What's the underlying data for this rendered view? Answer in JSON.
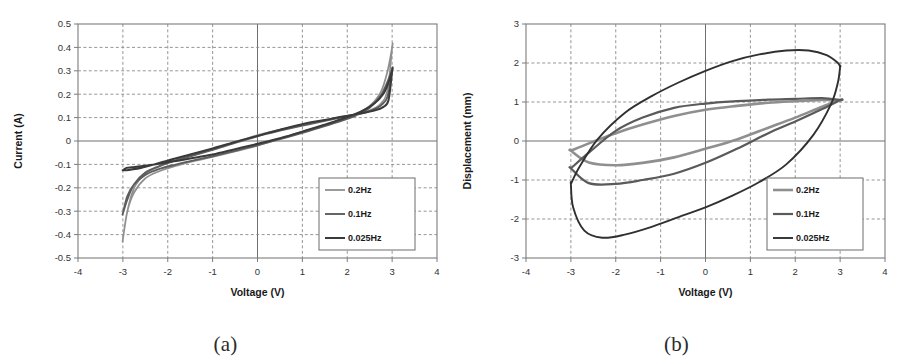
{
  "figure": {
    "panels": [
      {
        "id": "panel-a",
        "caption": "(a)",
        "chart_ref": 0
      },
      {
        "id": "panel-b",
        "caption": "(b)",
        "chart_ref": 1
      }
    ]
  },
  "chart_data": [
    {
      "type": "line",
      "title": "",
      "xlabel": "Voltage (V)",
      "ylabel": "Current (A)",
      "xlim": [
        -4,
        4
      ],
      "ylim": [
        -0.5,
        0.5
      ],
      "xticks": [
        -4,
        -3,
        -2,
        -1,
        0,
        1,
        2,
        3,
        4
      ],
      "xtick_labels": [
        "-4",
        "-3",
        "-2",
        "-1",
        "0",
        "1",
        "2",
        "3",
        "4"
      ],
      "yticks": [
        0.5,
        0.4,
        0.3,
        0.2,
        0.1,
        0,
        -0.1,
        -0.2,
        -0.3,
        -0.4,
        -0.5
      ],
      "ytick_labels": [
        "0.5",
        "0.4",
        "0.3",
        "0.2",
        "0.1",
        "0",
        "-0.1",
        "-0.2",
        "-0.3",
        "-0.4",
        "-0.5"
      ],
      "grid": true,
      "legend_position": "lower-right",
      "legend": [
        "0.2Hz",
        "0.1Hz",
        "0.025Hz"
      ],
      "series": [
        {
          "name": "0.2Hz",
          "color": "#8f8f8f",
          "width": 1.7,
          "upper_x": [
            -3.0,
            -2.9,
            -2.75,
            -2.5,
            -2.2,
            -1.8,
            -1.4,
            -1.0,
            -0.5,
            0.0,
            0.5,
            1.0,
            1.4,
            1.8,
            2.2,
            2.5,
            2.75,
            2.9,
            3.0
          ],
          "upper_y": [
            -0.42,
            -0.3,
            -0.22,
            -0.16,
            -0.13,
            -0.105,
            -0.085,
            -0.068,
            -0.045,
            -0.02,
            0.01,
            0.04,
            0.06,
            0.085,
            0.115,
            0.15,
            0.21,
            0.3,
            0.4
          ],
          "lower_x": [
            3.0,
            2.9,
            2.75,
            2.5,
            2.2,
            1.8,
            1.4,
            1.0,
            0.5,
            0.0,
            -0.5,
            -1.0,
            -1.4,
            -1.8,
            -2.2,
            -2.5,
            -2.75,
            -2.9,
            -3.0
          ],
          "lower_y": [
            0.4,
            0.22,
            0.16,
            0.13,
            0.115,
            0.1,
            0.085,
            0.07,
            0.048,
            0.025,
            -0.005,
            -0.035,
            -0.058,
            -0.08,
            -0.11,
            -0.14,
            -0.2,
            -0.3,
            -0.42
          ]
        },
        {
          "name": "0.1Hz",
          "color": "#5d5d5d",
          "width": 1.9,
          "upper_x": [
            -3.0,
            -2.9,
            -2.75,
            -2.5,
            -2.2,
            -1.8,
            -1.4,
            -1.0,
            -0.5,
            0.0,
            0.5,
            1.0,
            1.4,
            1.8,
            2.2,
            2.5,
            2.75,
            2.9,
            3.0
          ],
          "upper_y": [
            -0.31,
            -0.235,
            -0.185,
            -0.145,
            -0.12,
            -0.1,
            -0.082,
            -0.065,
            -0.042,
            -0.018,
            0.008,
            0.035,
            0.058,
            0.082,
            0.11,
            0.142,
            0.195,
            0.255,
            0.305
          ],
          "lower_x": [
            3.0,
            2.9,
            2.75,
            2.5,
            2.2,
            1.8,
            1.4,
            1.0,
            0.5,
            0.0,
            -0.5,
            -1.0,
            -1.4,
            -1.8,
            -2.2,
            -2.5,
            -2.75,
            -2.9,
            -3.0
          ],
          "lower_y": [
            0.305,
            0.19,
            0.152,
            0.128,
            0.112,
            0.098,
            0.082,
            0.066,
            0.044,
            0.02,
            -0.008,
            -0.038,
            -0.06,
            -0.082,
            -0.108,
            -0.135,
            -0.185,
            -0.25,
            -0.31
          ]
        },
        {
          "name": "0.025Hz",
          "color": "#3a3a3a",
          "width": 2.0,
          "upper_x": [
            -3.0,
            -2.92,
            -2.8,
            -2.6,
            -2.3,
            -1.9,
            -1.5,
            -1.0,
            -0.5,
            0.0,
            0.5,
            1.0,
            1.5,
            1.9,
            2.3,
            2.6,
            2.8,
            2.92,
            3.0
          ],
          "upper_y": [
            -0.125,
            -0.115,
            -0.112,
            -0.108,
            -0.1,
            -0.088,
            -0.075,
            -0.058,
            -0.035,
            -0.012,
            0.012,
            0.04,
            0.07,
            0.095,
            0.125,
            0.16,
            0.2,
            0.25,
            0.3
          ],
          "lower_x": [
            3.0,
            2.92,
            2.8,
            2.6,
            2.3,
            1.9,
            1.5,
            1.0,
            0.5,
            0.0,
            -0.5,
            -1.0,
            -1.5,
            -1.9,
            -2.3,
            -2.6,
            -2.8,
            -2.92,
            -3.0
          ],
          "lower_y": [
            0.3,
            0.175,
            0.145,
            0.13,
            0.118,
            0.105,
            0.09,
            0.072,
            0.048,
            0.022,
            -0.004,
            -0.032,
            -0.058,
            -0.078,
            -0.1,
            -0.115,
            -0.122,
            -0.125,
            -0.125
          ]
        }
      ]
    },
    {
      "type": "line",
      "title": "",
      "xlabel": "Voltage (V)",
      "ylabel": "Displacement (mm)",
      "xlim": [
        -4,
        4
      ],
      "ylim": [
        -3,
        3
      ],
      "xticks": [
        -4,
        -3,
        -2,
        -1,
        0,
        1,
        2,
        3,
        4
      ],
      "xtick_labels": [
        "-4",
        "-3",
        "-2",
        "-1",
        "0",
        "1",
        "2",
        "3",
        "4"
      ],
      "yticks": [
        3,
        2,
        1,
        0,
        -1,
        -2,
        -3
      ],
      "ytick_labels": [
        "3",
        "2",
        "1",
        "0",
        "-1",
        "-2",
        "-3"
      ],
      "grid": true,
      "legend_position": "lower-right",
      "legend": [
        "0.2Hz",
        "0.1Hz",
        "0.025Hz"
      ],
      "series": [
        {
          "name": "0.2Hz",
          "color": "#8f8f8f",
          "width": 2.6,
          "upper_x": [
            -3.0,
            -2.6,
            -2.0,
            -1.4,
            -0.7,
            0.0,
            0.7,
            1.4,
            2.0,
            2.6,
            3.0
          ],
          "upper_y": [
            -0.25,
            -0.06,
            0.2,
            0.42,
            0.64,
            0.8,
            0.9,
            0.98,
            1.02,
            1.05,
            1.05
          ],
          "lower_x": [
            3.0,
            2.6,
            2.0,
            1.4,
            0.7,
            0.0,
            -0.7,
            -1.4,
            -2.0,
            -2.6,
            -3.0
          ],
          "lower_y": [
            1.05,
            0.88,
            0.6,
            0.34,
            0.04,
            -0.2,
            -0.42,
            -0.56,
            -0.62,
            -0.55,
            -0.25
          ]
        },
        {
          "name": "0.1Hz",
          "color": "#5a5a5a",
          "width": 2.2,
          "upper_x": [
            -3.0,
            -2.6,
            -2.0,
            -1.4,
            -0.7,
            0.0,
            0.7,
            1.4,
            2.0,
            2.6,
            3.0
          ],
          "upper_y": [
            -0.7,
            -0.3,
            0.26,
            0.6,
            0.85,
            0.96,
            1.02,
            1.06,
            1.08,
            1.1,
            1.05
          ],
          "lower_x": [
            3.0,
            2.6,
            2.0,
            1.4,
            0.7,
            0.0,
            -0.7,
            -1.4,
            -2.0,
            -2.6,
            -3.0
          ],
          "lower_y": [
            1.05,
            0.82,
            0.5,
            0.2,
            -0.2,
            -0.56,
            -0.84,
            -1.0,
            -1.1,
            -1.08,
            -0.7
          ]
        },
        {
          "name": "0.025Hz",
          "color": "#303030",
          "width": 1.9,
          "upper_x": [
            -3.0,
            -2.8,
            -2.4,
            -1.8,
            -1.2,
            -0.6,
            0.0,
            0.6,
            1.2,
            1.8,
            2.3,
            2.7,
            2.95,
            3.0
          ],
          "upper_y": [
            -1.1,
            -0.65,
            0.05,
            0.72,
            1.15,
            1.5,
            1.8,
            2.05,
            2.22,
            2.32,
            2.32,
            2.2,
            2.0,
            1.9
          ],
          "lower_x": [
            3.0,
            2.95,
            2.8,
            2.4,
            1.8,
            1.2,
            0.6,
            0.0,
            -0.6,
            -1.2,
            -1.8,
            -2.3,
            -2.7,
            -2.95,
            -3.0
          ],
          "lower_y": [
            1.9,
            1.5,
            0.95,
            0.15,
            -0.6,
            -1.05,
            -1.4,
            -1.7,
            -1.95,
            -2.2,
            -2.4,
            -2.48,
            -2.3,
            -1.7,
            -1.1
          ]
        }
      ]
    }
  ]
}
